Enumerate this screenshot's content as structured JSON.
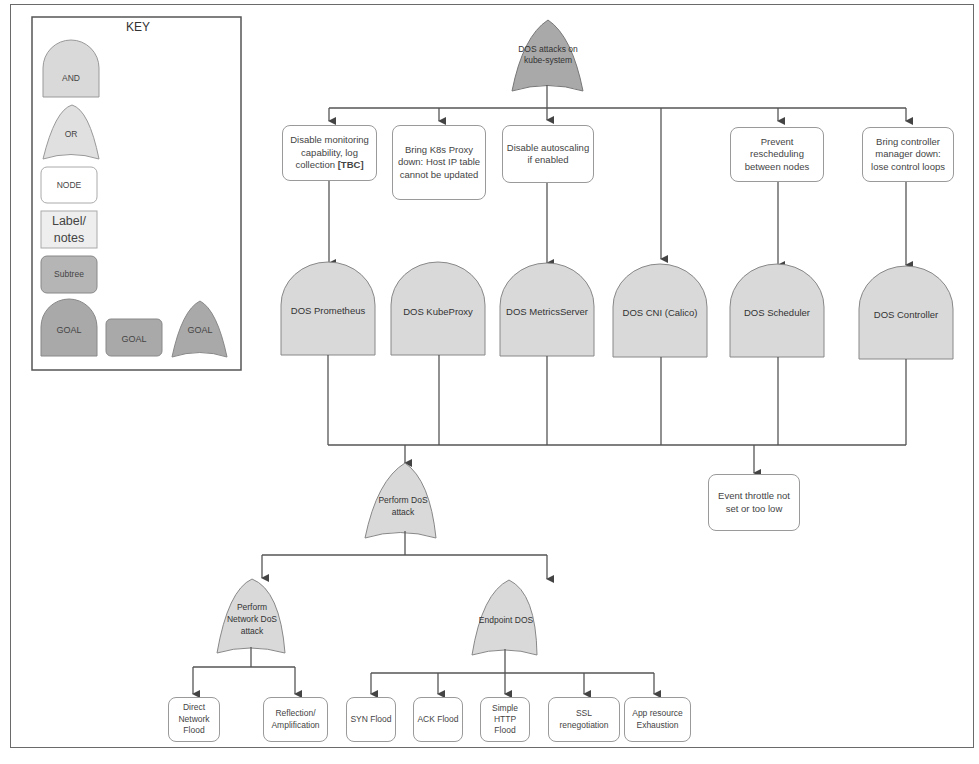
{
  "key": {
    "title": "KEY",
    "items": [
      {
        "shape": "and-gate",
        "label": "AND"
      },
      {
        "shape": "or-gate",
        "label": "OR"
      },
      {
        "shape": "node",
        "label": "NODE"
      },
      {
        "shape": "label-notes",
        "label": "Label/ notes"
      },
      {
        "shape": "subtree",
        "label": "Subtree"
      },
      {
        "shape": "goal-and",
        "label": "GOAL"
      },
      {
        "shape": "goal-rect",
        "label": "GOAL"
      },
      {
        "shape": "goal-or",
        "label": "GOAL"
      }
    ]
  },
  "colors": {
    "gate_fill": "#d9d9d9",
    "goal_fill": "#a9a9a9",
    "subtree_fill": "#b5b5b5",
    "label_fill": "#eeeeee",
    "stroke": "#555555",
    "node_border": "#9a9a9a"
  },
  "root": {
    "label": "DOS attacks on kube-system",
    "type": "goal-or"
  },
  "conditions": [
    {
      "label": "Disable monitoring capability, log collection",
      "suffix": "[TBC]"
    },
    {
      "label": "Bring K8s Proxy down: Host IP table cannot be updated"
    },
    {
      "label": "Disable autoscaling if enabled"
    },
    {
      "label": "Prevent rescheduling between nodes"
    },
    {
      "label": "Bring controller manager down: lose control loops"
    }
  ],
  "and_gates": [
    {
      "label": "DOS Prometheus"
    },
    {
      "label": "DOS KubeProxy"
    },
    {
      "label": "DOS MetricsServer"
    },
    {
      "label": "DOS CNI (Calico)"
    },
    {
      "label": "DOS Scheduler"
    },
    {
      "label": "DOS Controller"
    }
  ],
  "perform_dos": {
    "label": "Perform DoS attack",
    "type": "or-gate"
  },
  "event_throttle": {
    "label": "Event throttle not set or too low"
  },
  "network_dos": {
    "label": "Perform Network DoS attack",
    "type": "or-gate"
  },
  "endpoint_dos": {
    "label": "Endpoint DOS",
    "type": "or-gate"
  },
  "network_leaves": [
    {
      "label": "Direct Network Flood"
    },
    {
      "label": "Reflection/ Amplification"
    }
  ],
  "endpoint_leaves": [
    {
      "label": "SYN Flood"
    },
    {
      "label": "ACK Flood"
    },
    {
      "label": "Simple HTTP Flood"
    },
    {
      "label": "SSL renegotiation"
    },
    {
      "label": "App resource Exhaustion"
    }
  ]
}
